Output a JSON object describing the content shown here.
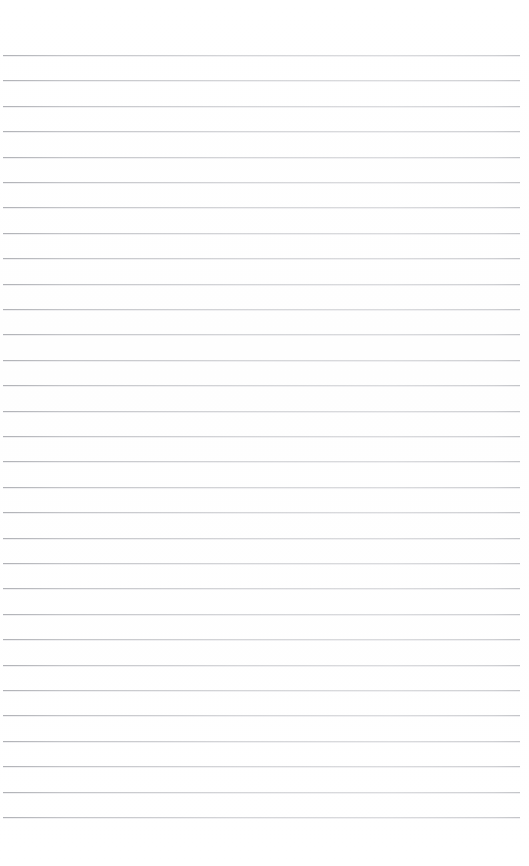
{
  "document": {
    "kind": "blank-ruled-paper",
    "title": "",
    "body_text": "",
    "page_width": 529,
    "page_height": 866,
    "background_color": "#ffffff",
    "has_text": false,
    "has_margin_rule": false,
    "has_header": false,
    "has_footer": false,
    "has_page_number": false
  },
  "ruling": {
    "line_color": "#a6a8ae",
    "line_thickness": 1,
    "line_count": 31,
    "first_line_y": 55,
    "line_spacing": 25.4,
    "line_start_x": 3,
    "line_end_x": 520,
    "top_margin": 52,
    "bottom_margin": 48,
    "left_margin": 3,
    "right_margin": 9
  },
  "lines": [
    {
      "index": 1,
      "y": 55,
      "x1": 3,
      "x2": 520,
      "content": ""
    },
    {
      "index": 2,
      "y": 80,
      "x1": 3,
      "x2": 520,
      "content": ""
    },
    {
      "index": 3,
      "y": 106,
      "x1": 3,
      "x2": 520,
      "content": ""
    },
    {
      "index": 4,
      "y": 131,
      "x1": 3,
      "x2": 520,
      "content": ""
    },
    {
      "index": 5,
      "y": 157,
      "x1": 3,
      "x2": 520,
      "content": ""
    },
    {
      "index": 6,
      "y": 182,
      "x1": 3,
      "x2": 520,
      "content": ""
    },
    {
      "index": 7,
      "y": 207,
      "x1": 3,
      "x2": 520,
      "content": ""
    },
    {
      "index": 8,
      "y": 233,
      "x1": 3,
      "x2": 520,
      "content": ""
    },
    {
      "index": 9,
      "y": 258,
      "x1": 3,
      "x2": 520,
      "content": ""
    },
    {
      "index": 10,
      "y": 284,
      "x1": 3,
      "x2": 520,
      "content": ""
    },
    {
      "index": 11,
      "y": 309,
      "x1": 3,
      "x2": 520,
      "content": ""
    },
    {
      "index": 12,
      "y": 334,
      "x1": 3,
      "x2": 520,
      "content": ""
    },
    {
      "index": 13,
      "y": 360,
      "x1": 3,
      "x2": 520,
      "content": ""
    },
    {
      "index": 14,
      "y": 385,
      "x1": 3,
      "x2": 520,
      "content": ""
    },
    {
      "index": 15,
      "y": 411,
      "x1": 3,
      "x2": 520,
      "content": ""
    },
    {
      "index": 16,
      "y": 436,
      "x1": 3,
      "x2": 520,
      "content": ""
    },
    {
      "index": 17,
      "y": 461,
      "x1": 3,
      "x2": 520,
      "content": ""
    },
    {
      "index": 18,
      "y": 487,
      "x1": 3,
      "x2": 520,
      "content": ""
    },
    {
      "index": 19,
      "y": 512,
      "x1": 3,
      "x2": 520,
      "content": ""
    },
    {
      "index": 20,
      "y": 538,
      "x1": 3,
      "x2": 520,
      "content": ""
    },
    {
      "index": 21,
      "y": 563,
      "x1": 3,
      "x2": 520,
      "content": ""
    },
    {
      "index": 22,
      "y": 588,
      "x1": 3,
      "x2": 520,
      "content": ""
    },
    {
      "index": 23,
      "y": 614,
      "x1": 3,
      "x2": 520,
      "content": ""
    },
    {
      "index": 24,
      "y": 639,
      "x1": 3,
      "x2": 520,
      "content": ""
    },
    {
      "index": 25,
      "y": 665,
      "x1": 3,
      "x2": 520,
      "content": ""
    },
    {
      "index": 26,
      "y": 690,
      "x1": 3,
      "x2": 520,
      "content": ""
    },
    {
      "index": 27,
      "y": 715,
      "x1": 3,
      "x2": 520,
      "content": ""
    },
    {
      "index": 28,
      "y": 741,
      "x1": 3,
      "x2": 520,
      "content": ""
    },
    {
      "index": 29,
      "y": 766,
      "x1": 3,
      "x2": 520,
      "content": ""
    },
    {
      "index": 30,
      "y": 792,
      "x1": 3,
      "x2": 520,
      "content": ""
    },
    {
      "index": 31,
      "y": 817,
      "x1": 3,
      "x2": 520,
      "content": ""
    }
  ]
}
